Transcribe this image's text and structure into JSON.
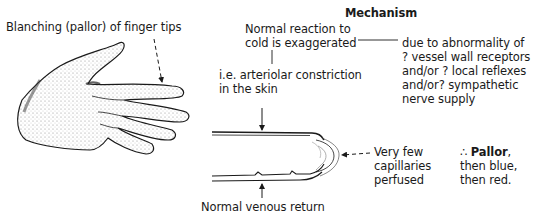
{
  "title": "Mechanism",
  "labels": {
    "blanching": "Blanching (pallor) of finger tips",
    "normal_reaction_line1": "Normal reaction to",
    "normal_reaction_line2": "cold is exaggerated",
    "due_to_line1": "due to abnormality of",
    "due_to_line2": "? vessel wall receptors",
    "due_to_line3": "and/or ? local reflexes",
    "due_to_line4": "and/or? sympathetic",
    "due_to_line5": "nerve supply",
    "ie_line1": "i.e. arteriolar constriction",
    "ie_line2": "in the skin",
    "very_few_line1": "Very few",
    "very_few_line2": "capillaries",
    "very_few_line3": "perfused",
    "therefore_symbol": "∴",
    "pallor": "Pallor",
    "pallor_comma": ",",
    "then_blue": "then blue,",
    "then_red": "then red.",
    "venous_return": "Normal venous return"
  },
  "colors": {
    "ink": "#1a1a1a",
    "background": "#ffffff",
    "shading": "#555555"
  }
}
